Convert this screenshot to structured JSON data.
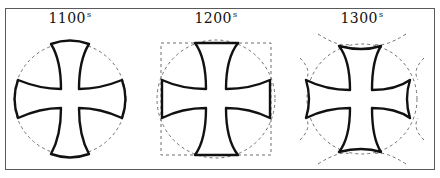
{
  "diagram": {
    "panels": [
      {
        "label": "1100",
        "suffix": "s",
        "construction": "circle"
      },
      {
        "label": "1200",
        "suffix": "s",
        "construction": "circle-and-square"
      },
      {
        "label": "1300",
        "suffix": "s",
        "construction": "circle-and-outer-arcs"
      }
    ]
  },
  "colors": {
    "stroke": "#111111",
    "guide": "#6e6e6e",
    "frame": "#5a5a5a",
    "background": "#ffffff"
  }
}
